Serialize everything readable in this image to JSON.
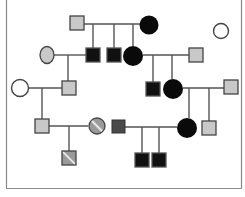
{
  "diagram": {
    "type": "pedigree-chart",
    "colors": {
      "affected": "#0a0a0a",
      "carrier_gray": "#c8c8c8",
      "unaffected": "#ffffff",
      "line": "#555555",
      "frame": "#888888"
    },
    "frame": {
      "x1": 6,
      "x2": 241,
      "bottom": 188
    },
    "individuals": [
      {
        "id": "I-1",
        "sex": "male",
        "fill": "gray",
        "x": 77,
        "y": 23
      },
      {
        "id": "I-2",
        "sex": "female",
        "fill": "black",
        "x": 149,
        "y": 25
      },
      {
        "id": "I-3",
        "sex": "female",
        "fill": "white",
        "x": 221,
        "y": 31
      },
      {
        "id": "II-1",
        "sex": "female",
        "fill": "gray",
        "x": 47,
        "y": 55
      },
      {
        "id": "II-2",
        "sex": "male",
        "fill": "black",
        "x": 93,
        "y": 55
      },
      {
        "id": "II-3",
        "sex": "male",
        "fill": "black",
        "x": 114,
        "y": 55
      },
      {
        "id": "II-4",
        "sex": "female",
        "fill": "black",
        "x": 133,
        "y": 56
      },
      {
        "id": "II-5",
        "sex": "male",
        "fill": "gray",
        "x": 196,
        "y": 55
      },
      {
        "id": "III-1",
        "sex": "female",
        "fill": "white",
        "x": 20,
        "y": 88
      },
      {
        "id": "III-2",
        "sex": "male",
        "fill": "gray",
        "x": 69,
        "y": 88
      },
      {
        "id": "III-3",
        "sex": "male",
        "fill": "black",
        "x": 153,
        "y": 89
      },
      {
        "id": "III-4",
        "sex": "female",
        "fill": "black",
        "x": 173,
        "y": 89
      },
      {
        "id": "III-5",
        "sex": "male",
        "fill": "gray",
        "x": 231,
        "y": 87
      },
      {
        "id": "IV-1",
        "sex": "male",
        "fill": "gray",
        "x": 42,
        "y": 126
      },
      {
        "id": "IV-2",
        "sex": "female",
        "fill": "hatched",
        "x": 97,
        "y": 126
      },
      {
        "id": "IV-3",
        "sex": "male",
        "fill": "darkgray",
        "x": 118,
        "y": 126
      },
      {
        "id": "IV-4",
        "sex": "female",
        "fill": "black",
        "x": 187,
        "y": 128
      },
      {
        "id": "IV-5",
        "sex": "male",
        "fill": "gray",
        "x": 209,
        "y": 128
      },
      {
        "id": "V-1",
        "sex": "male",
        "fill": "hatched",
        "x": 69,
        "y": 158
      },
      {
        "id": "V-2",
        "sex": "male",
        "fill": "black",
        "x": 142,
        "y": 160
      },
      {
        "id": "V-3",
        "sex": "male",
        "fill": "black",
        "x": 159,
        "y": 160
      }
    ]
  }
}
